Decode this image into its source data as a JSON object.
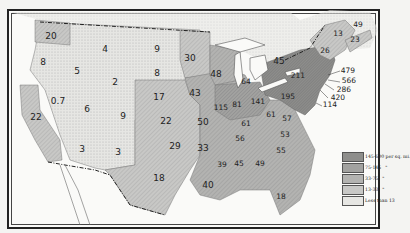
{
  "map": {
    "subject": "Population density per square mile",
    "colors": {
      "c145_600": "#8e8e8c",
      "c75_145": "#a2a2a0",
      "c33_75": "#b3b3b1",
      "c13_33": "#c8c8c6",
      "lt13": "#e6e6e3",
      "water": "#fafaf8",
      "border": "#555555"
    },
    "labels": {
      "washington": "20",
      "oregon": "8",
      "idaho": "5",
      "montana": "4",
      "wyoming": "2",
      "north_dakota": "9",
      "south_dakota": "8",
      "minnesota": "30",
      "nevada": "0.7",
      "utah": "6",
      "colorado": "9",
      "california": "22",
      "arizona": "3",
      "new_mexico": "3",
      "nebraska": "17",
      "kansas": "22",
      "oklahoma": "29",
      "texas": "18",
      "iowa": "43",
      "missouri": "50",
      "arkansas": "33",
      "louisiana": "40",
      "wisconsin": "48",
      "michigan": "64",
      "illinois": "115",
      "indiana": "81",
      "ohio": "141",
      "kentucky": "61",
      "tennessee": "56",
      "west_virginia": "61",
      "virginia": "57",
      "north_carolina": "53",
      "south_carolina": "55",
      "georgia": "49",
      "alabama": "45",
      "mississippi": "39",
      "florida": "18",
      "pennsylvania": "195",
      "new_york": "211",
      "ontario": "45",
      "vermont": "",
      "maine": "26",
      "new_brunswick": "13",
      "nova_scotia": "23",
      "pei": "49",
      "massachusetts": "479",
      "rhode_island": "566",
      "connecticut": "286",
      "new_jersey": "420",
      "delaware": "114"
    },
    "legend": [
      {
        "label": "145-600 per sq. mi.",
        "mark": ""
      },
      {
        "label": "75-145",
        "mark": "\""
      },
      {
        "label": "33-75",
        "mark": "\""
      },
      {
        "label": "13-33",
        "mark": "\""
      },
      {
        "label": "Less than 13",
        "mark": ""
      }
    ]
  }
}
